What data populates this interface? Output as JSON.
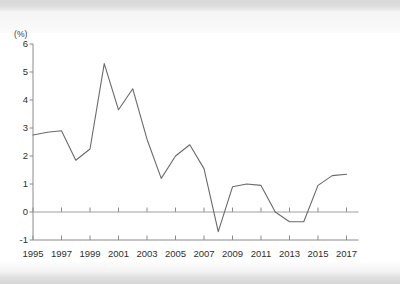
{
  "chart_data": {
    "type": "line",
    "title": "",
    "subtitle": "",
    "xlabel": "",
    "ylabel": "",
    "unit_label": "(%)",
    "x": [
      1995,
      1996,
      1997,
      1998,
      1999,
      2000,
      2001,
      2002,
      2003,
      2004,
      2005,
      2006,
      2007,
      2008,
      2009,
      2010,
      2011,
      2012,
      2013,
      2014,
      2015,
      2016,
      2017
    ],
    "values": [
      2.75,
      2.85,
      2.9,
      1.85,
      2.25,
      5.3,
      3.65,
      4.4,
      2.6,
      1.2,
      2.0,
      2.4,
      1.55,
      -0.7,
      0.9,
      1.0,
      0.95,
      0.0,
      -0.35,
      -0.35,
      0.95,
      1.3,
      1.35
    ],
    "series": [
      {
        "name": "",
        "values": [
          2.75,
          2.85,
          2.9,
          1.85,
          2.25,
          5.3,
          3.65,
          4.4,
          2.6,
          1.2,
          2.0,
          2.4,
          1.55,
          -0.7,
          0.9,
          1.0,
          0.95,
          0.0,
          -0.35,
          -0.35,
          0.95,
          1.3,
          1.35
        ]
      }
    ],
    "ylim": [
      -1,
      6
    ],
    "yticks": [
      6,
      5,
      4,
      3,
      2,
      1,
      0,
      -1
    ],
    "ytick_labels": [
      "6",
      "5",
      "4",
      "3",
      "2",
      "1",
      "0",
      "-1"
    ],
    "xlim": [
      1995,
      2017
    ],
    "xticks": [
      1995,
      1997,
      1999,
      2001,
      2003,
      2005,
      2007,
      2009,
      2011,
      2013,
      2015,
      2017
    ],
    "xtick_labels": [
      "1995",
      "1997",
      "1999",
      "2001",
      "2003",
      "2005",
      "2007",
      "2009",
      "2011",
      "2013",
      "2015",
      "2017"
    ],
    "grid": false,
    "zero_line": true,
    "legend": null,
    "legend_position": "none",
    "annotations": [],
    "colors": {
      "line": "#6a6a6a",
      "axis": "#8a8a8a",
      "zero_line": "#9a9a9a",
      "text": "#2f2f2f",
      "background": "#ffffff"
    }
  }
}
